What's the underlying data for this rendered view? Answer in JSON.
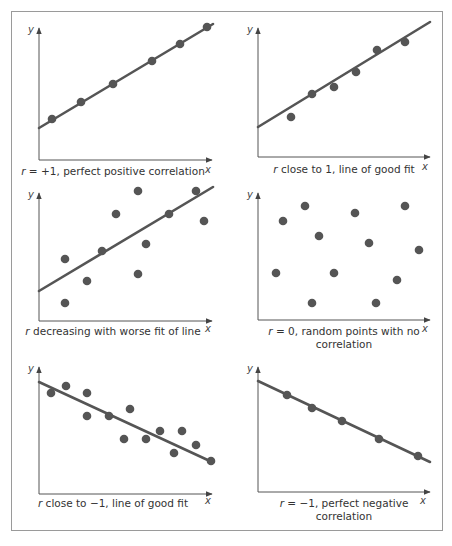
{
  "chart_data": [
    {
      "type": "scatter",
      "panel": "top-left",
      "caption_var": "r",
      "caption_rest": " = +1, perfect positive correlation",
      "caption": "r = +1, perfect positive correlation",
      "xlabel": "x",
      "ylabel": "y",
      "grid": false,
      "fit_line": {
        "x": [
          0,
          174
        ],
        "y": [
          32,
          136
        ]
      },
      "axis_origin": [
        39,
        160
      ],
      "points": [
        [
          13,
          41
        ],
        [
          42,
          58
        ],
        [
          74,
          76
        ],
        [
          113,
          99
        ],
        [
          141,
          116
        ],
        [
          168,
          133
        ]
      ]
    },
    {
      "type": "scatter",
      "panel": "top-right",
      "caption_var": "r",
      "caption_rest": " close to 1, line of good fit",
      "caption": "r close to 1, line of good fit",
      "xlabel": "x",
      "ylabel": "y",
      "grid": false,
      "fit_line": {
        "x": [
          0,
          172
        ],
        "y": [
          30,
          135
        ]
      },
      "axis_origin": [
        258,
        157
      ],
      "points": [
        [
          33,
          40
        ],
        [
          54,
          63
        ],
        [
          76,
          70
        ],
        [
          98,
          85
        ],
        [
          119,
          107
        ],
        [
          147,
          115
        ]
      ]
    },
    {
      "type": "scatter",
      "panel": "middle-left",
      "caption_var": "r",
      "caption_rest": " decreasing with worse fit of line",
      "caption": "r decreasing with worse fit of line",
      "xlabel": "x",
      "ylabel": "y",
      "grid": false,
      "fit_line": {
        "x": [
          0,
          174
        ],
        "y": [
          30,
          134
        ]
      },
      "axis_origin": [
        39,
        321
      ],
      "points": [
        [
          26,
          62
        ],
        [
          48,
          40
        ],
        [
          63,
          70
        ],
        [
          77,
          107
        ],
        [
          99,
          130
        ],
        [
          107,
          77
        ],
        [
          99,
          47
        ],
        [
          130,
          107
        ],
        [
          157,
          130
        ],
        [
          165,
          100
        ],
        [
          26,
          18
        ]
      ]
    },
    {
      "type": "scatter",
      "panel": "middle-right",
      "caption_var": "r",
      "caption_rest": " = 0, random points with no",
      "caption_line2": "correlation",
      "caption": "r = 0, random points with no correlation",
      "xlabel": "x",
      "ylabel": "y",
      "grid": false,
      "fit_line": null,
      "axis_origin": [
        258,
        320
      ],
      "points": [
        [
          25,
          99
        ],
        [
          47,
          114
        ],
        [
          61,
          84
        ],
        [
          18,
          47
        ],
        [
          76,
          47
        ],
        [
          97,
          107
        ],
        [
          111,
          77
        ],
        [
          54,
          17
        ],
        [
          118,
          17
        ],
        [
          139,
          40
        ],
        [
          147,
          114
        ],
        [
          161,
          70
        ]
      ]
    },
    {
      "type": "scatter",
      "panel": "bottom-left",
      "caption_var": "r",
      "caption_rest": " close to −1, line of good fit",
      "caption": "r close to −1, line of good fit",
      "xlabel": "x",
      "ylabel": "y",
      "grid": false,
      "fit_line": {
        "x": [
          0,
          173
        ],
        "y": [
          112,
          32
        ]
      },
      "axis_origin": [
        39,
        494
      ],
      "points": [
        [
          12,
          101
        ],
        [
          27,
          108
        ],
        [
          48,
          101
        ],
        [
          48,
          78
        ],
        [
          70,
          78
        ],
        [
          91,
          85
        ],
        [
          85,
          55
        ],
        [
          107,
          55
        ],
        [
          121,
          63
        ],
        [
          135,
          41
        ],
        [
          143,
          63
        ],
        [
          157,
          49
        ],
        [
          172,
          33
        ]
      ]
    },
    {
      "type": "scatter",
      "panel": "bottom-right",
      "caption_var": "r",
      "caption_rest": " = −1, perfect negative",
      "caption_line2": "correlation",
      "caption": "r = −1, perfect negative correlation",
      "xlabel": "x",
      "ylabel": "y",
      "grid": false,
      "fit_line": {
        "x": [
          0,
          172
        ],
        "y": [
          111,
          30
        ]
      },
      "axis_origin": [
        258,
        492
      ],
      "points": [
        [
          29,
          97
        ],
        [
          54,
          84
        ],
        [
          84,
          71
        ],
        [
          121,
          53
        ],
        [
          160,
          36
        ]
      ]
    }
  ],
  "colors": {
    "frame": "#9a9a9a",
    "axis": "#555555",
    "series": "#555555",
    "text": "#333333"
  }
}
